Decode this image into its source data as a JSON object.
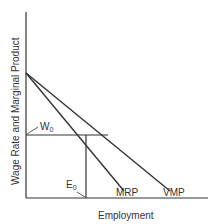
{
  "diagram": {
    "y_axis_label": "Wage Rate and Marginal Product",
    "x_axis_label": "Employment",
    "curves": [
      {
        "name": "MRP",
        "label": "MRP"
      },
      {
        "name": "VMP",
        "label": "VMP"
      }
    ],
    "wage_label": "W",
    "wage_subscript": "0",
    "employment_label": "E",
    "employment_subscript": "0",
    "line_color": "#333333"
  }
}
